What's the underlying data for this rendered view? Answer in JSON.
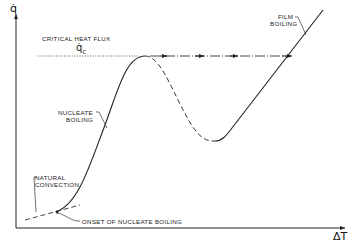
{
  "diagram": {
    "type": "boiling-curve",
    "axes": {
      "y_label": "q̇",
      "x_label": "ΔT"
    },
    "labels": {
      "critical_heat_flux": "CRITICAL HEAT FLUX",
      "qc_symbol": "q̇",
      "qc_subscript": "c",
      "film_boiling_line1": "FILM",
      "film_boiling_line2": "BOILING",
      "nucleate_boiling_line1": "NUCLEATE",
      "nucleate_boiling_line2": "BOILING",
      "natural_convection_line1": "NATURAL",
      "natural_convection_line2": "CONVECTION",
      "onset_nucleate_boiling": "ONSET OF NUCLEATE BOILING"
    },
    "colors": {
      "ink": "#222222",
      "background": "#ffffff"
    }
  }
}
